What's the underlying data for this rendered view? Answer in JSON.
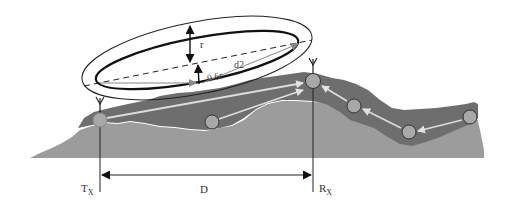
{
  "diagram": {
    "labels": {
      "transmitter": "T",
      "transmitter_sub": "X",
      "receiver": "R",
      "receiver_sub": "X",
      "distance": "D",
      "radius": "r",
      "clearance": "0.6r",
      "distance2": "d2"
    },
    "colors": {
      "background": "#ffffff",
      "terrain_dark": "#6e6e6e",
      "terrain_light": "#9c9c9c",
      "node_fill": "#a8a8a8",
      "node_stroke": "#3a3a3a",
      "link_arrow": "#d8d8d8",
      "ellipse_stroke": "#111111",
      "dimension_line": "#222222"
    },
    "nodes": [
      {
        "id": "tx",
        "x": 100,
        "y": 120
      },
      {
        "id": "n1",
        "x": 212,
        "y": 122
      },
      {
        "id": "rx",
        "x": 313,
        "y": 81
      },
      {
        "id": "n2",
        "x": 354,
        "y": 106
      },
      {
        "id": "n3",
        "x": 409,
        "y": 132
      },
      {
        "id": "n4",
        "x": 470,
        "y": 117
      }
    ],
    "links": [
      {
        "from": "tx",
        "to": "rx"
      },
      {
        "from": "n1",
        "to": "rx"
      },
      {
        "from": "n2",
        "to": "rx"
      },
      {
        "from": "n3",
        "to": "n2"
      },
      {
        "from": "n4",
        "to": "n3"
      }
    ]
  }
}
